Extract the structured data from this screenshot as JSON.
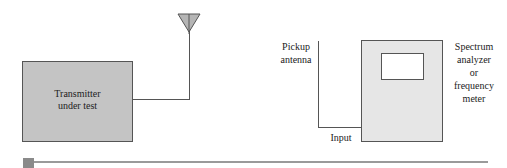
{
  "diagram": {
    "transmitter": {
      "label_line1": "Transmitter",
      "label_line2": "under test",
      "fill": "#c4c4c4"
    },
    "pickup": {
      "label_line1": "Pickup",
      "label_line2": "antenna"
    },
    "input_label": "Input",
    "analyzer": {
      "label_line1": "Spectrum",
      "label_line2": "analyzer",
      "label_line3": "or",
      "label_line4": "frequency",
      "label_line5": "meter",
      "fill": "#e6e6e6"
    },
    "rule_color": "#9a9a9a"
  }
}
